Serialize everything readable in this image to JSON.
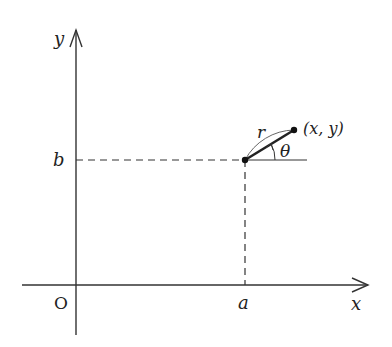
{
  "diagram": {
    "title": "",
    "axes": {
      "x_label": "x",
      "y_label": "y",
      "origin_label": "O"
    },
    "labels": {
      "a": "a",
      "b": "b",
      "r": "r",
      "theta": "θ",
      "point": "(x, y)"
    },
    "points": [
      {
        "name": "center",
        "coords": "(a, b)"
      },
      {
        "name": "endpoint",
        "coords": "(x, y)"
      }
    ],
    "colors": {
      "stroke": "#333333",
      "text": "#222222",
      "background": "#ffffff"
    }
  }
}
